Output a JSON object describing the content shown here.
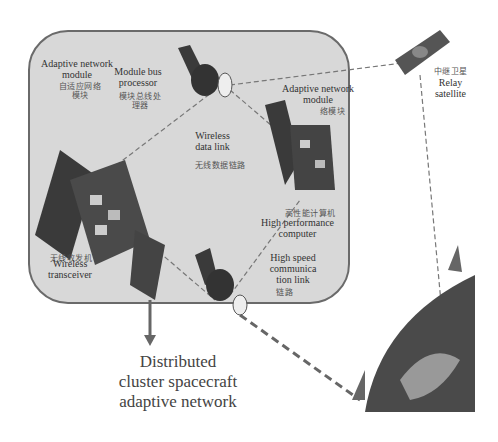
{
  "diagram": {
    "title": "Distributed cluster spacecraft adaptive network",
    "caption_lines": [
      "Distributed",
      "cluster spacecraft",
      "adaptive network"
    ],
    "labels": {
      "adaptive_network_module_left": [
        "Adaptive network",
        "module"
      ],
      "adaptive_network_module_left_cn": [
        "自适应网络",
        "模块"
      ],
      "module_bus_processor": [
        "Module bus",
        "processor"
      ],
      "module_bus_processor_cn": [
        "模块总线处",
        "理器"
      ],
      "wireless_data_link": [
        "Wireless",
        "data link"
      ],
      "wireless_data_link_cn": "无线数据链路",
      "adaptive_network_module_right": [
        "Adaptive network",
        "module"
      ],
      "adaptive_network_module_right_cn": [
        "自适应网",
        "络模块"
      ],
      "high_performance_computer": [
        "High performance",
        "computer"
      ],
      "high_performance_computer_cn": "高性能计算机",
      "high_speed_link": [
        "High speed",
        "communica",
        "tion link"
      ],
      "high_speed_link_cn": [
        "高速通信",
        "链路"
      ],
      "wireless_transceiver": [
        "Wireless",
        "transceiver"
      ],
      "wireless_transceiver_cn": "无线收发机",
      "relay_satellite": [
        "Relay",
        "satellite"
      ],
      "relay_satellite_cn": "中继卫星"
    },
    "nodes": [
      "left-spacecraft",
      "top-spacecraft",
      "right-spacecraft",
      "bottom-spacecraft",
      "relay-satellite",
      "earth",
      "ground-antenna-top",
      "ground-antenna-left"
    ],
    "colors": {
      "panel_bg": "#d8d8d8",
      "panel_border": "#6a6a6a",
      "craft_dark": "#3a3a3a",
      "earth": "#4a4a4a"
    }
  }
}
